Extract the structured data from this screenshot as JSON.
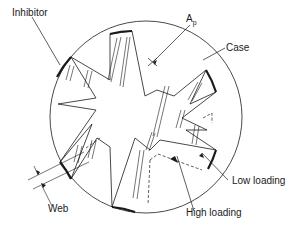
{
  "diagram": {
    "labels": {
      "inhibitor": "Inhibitor",
      "ap_main": "A",
      "ap_sub": "p",
      "case": "Case",
      "web": "Web",
      "low_loading": "Low loading",
      "high_loading": "High loading"
    },
    "caption": "",
    "colors": {
      "line": "#1a1a1a",
      "background": "#ffffff"
    }
  }
}
